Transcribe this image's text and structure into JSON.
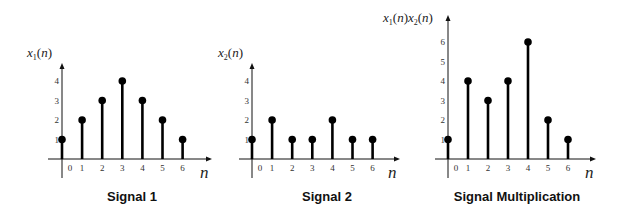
{
  "chart_data": [
    {
      "type": "stem",
      "title": "Signal 1",
      "ylabel": "x1(n)",
      "xlabel": "n",
      "categories": [
        0,
        1,
        2,
        3,
        4,
        5,
        6
      ],
      "values": [
        1,
        2,
        3,
        4,
        3,
        2,
        1
      ],
      "yticks": [
        1,
        2,
        3,
        4
      ],
      "ylim": [
        0,
        4.5
      ],
      "grid": false
    },
    {
      "type": "stem",
      "title": "Signal 2",
      "ylabel": "x2(n)",
      "xlabel": "n",
      "categories": [
        0,
        1,
        2,
        3,
        4,
        5,
        6
      ],
      "values": [
        1,
        2,
        1,
        1,
        2,
        1,
        1
      ],
      "yticks": [
        1,
        2,
        3,
        4
      ],
      "ylim": [
        0,
        4.5
      ],
      "grid": false
    },
    {
      "type": "stem",
      "title": "Signal Multiplication",
      "ylabel": "x1(n)x2(n)",
      "xlabel": "n",
      "categories": [
        0,
        1,
        2,
        3,
        4,
        5,
        6
      ],
      "values": [
        1,
        4,
        3,
        4,
        6,
        2,
        1
      ],
      "yticks": [
        1,
        2,
        3,
        4,
        5,
        6
      ],
      "ylim": [
        0,
        7.3
      ],
      "grid": false
    }
  ],
  "layout": [
    {
      "origin_x": 62,
      "origin_y": 159,
      "axis_top": 63,
      "axis_right": 212,
      "axis_bottom": 178,
      "axis_left": 48,
      "step_x": 20.1,
      "unit_y": 19.5,
      "ylabel_x": 27,
      "ylabel_y": 57,
      "n_x": 200,
      "n_y": 178,
      "caption_x": 132,
      "caption_y": 201
    },
    {
      "origin_x": 252,
      "origin_y": 159,
      "axis_top": 63,
      "axis_right": 400,
      "axis_bottom": 178,
      "axis_left": 239,
      "step_x": 20.1,
      "unit_y": 19.5,
      "ylabel_x": 218,
      "ylabel_y": 57,
      "n_x": 388,
      "n_y": 178,
      "caption_x": 327,
      "caption_y": 201
    },
    {
      "origin_x": 448,
      "origin_y": 159,
      "axis_top": 15,
      "axis_right": 596,
      "axis_bottom": 178,
      "axis_left": 435,
      "step_x": 20.0,
      "unit_y": 19.5,
      "ylabel_x": 383,
      "ylabel_y": 22,
      "n_x": 585,
      "n_y": 178,
      "caption_x": 517,
      "caption_y": 201
    }
  ],
  "colors": {
    "stem": "#000000",
    "axis": "#111111",
    "background": "#ffffff"
  }
}
